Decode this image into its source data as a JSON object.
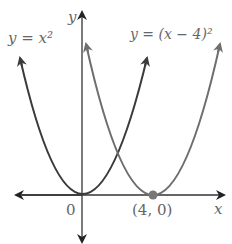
{
  "labels": {
    "curve1": "y = x²",
    "curve2": "y = (x − 4)²",
    "y_axis": "y",
    "x_axis": "x",
    "origin": "0",
    "vertex2": "(4, 0)"
  },
  "colors": {
    "curve1": "#3a3a3a",
    "curve2": "#6e6e6e",
    "axes": "#333333",
    "point": "#777777"
  }
}
